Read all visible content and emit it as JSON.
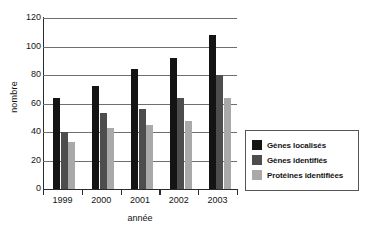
{
  "chart_data": {
    "type": "bar",
    "title": "",
    "xlabel": "année",
    "ylabel": "nombre",
    "categories": [
      "1999",
      "2000",
      "2001",
      "2002",
      "2003"
    ],
    "series": [
      {
        "name": "Gènes localisés",
        "color": "#141414",
        "values": [
          64,
          72,
          84,
          92,
          108
        ]
      },
      {
        "name": "Gènes identifiés",
        "color": "#4d4d4d",
        "values": [
          40,
          53,
          56,
          64,
          80
        ]
      },
      {
        "name": "Protéines identifiées",
        "color": "#a9a9a9",
        "values": [
          33,
          43,
          45,
          48,
          64
        ]
      }
    ],
    "ylim": [
      0,
      120
    ],
    "yticks": [
      0,
      20,
      40,
      60,
      80,
      100,
      120
    ],
    "ytick_labels": [
      "0",
      "20",
      "40",
      "60",
      "80",
      "100",
      "120"
    ],
    "grid": true,
    "legend_position": "right"
  },
  "legend": {
    "items": [
      {
        "label": "Gènes localisés"
      },
      {
        "label": "Gènes identifiés"
      },
      {
        "label": "Protéines identifiées"
      }
    ]
  }
}
